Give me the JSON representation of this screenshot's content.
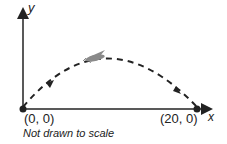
{
  "diagram": {
    "y_axis_label": "y",
    "x_axis_label": "x",
    "start_point_label": "(0, 0)",
    "end_point_label": "(20, 0)",
    "note": "Not drawn to scale",
    "object": "grasshopper",
    "path_style": "dashed parabola",
    "colors": {
      "line": "#222222",
      "grasshopper": "#8a8a8a"
    }
  }
}
